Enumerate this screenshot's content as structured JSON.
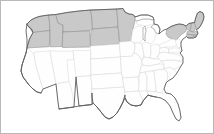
{
  "figure": {
    "type": "choropleth-map",
    "region": "United States",
    "width": 214,
    "height": 134,
    "background_color": "#ffffff",
    "border_color": "#b9b9b9"
  },
  "legend": {
    "shaded_color": "#c9c9c9",
    "shaded_border_color": "#8e8e8e",
    "unshaded_color": "#fefefe",
    "unshaded_border_color": "#d8d8d8",
    "outline_color": "#5f5f5f"
  },
  "chart_data": {
    "type": "map",
    "title": "",
    "subtitle": "",
    "xlabel": "",
    "ylabel": "",
    "legend_position": "none",
    "grid": false,
    "value_scale": [
      "unshaded",
      "shaded"
    ],
    "categories": [
      "WA",
      "OR",
      "ID",
      "MT",
      "WY",
      "ND",
      "SD",
      "MN",
      "CA",
      "NV",
      "UT",
      "AZ",
      "CO",
      "NM",
      "NE",
      "KS",
      "OK",
      "TX",
      "IA",
      "MO",
      "AR",
      "LA",
      "WI",
      "MI",
      "IL",
      "IN",
      "OH",
      "KY",
      "TN",
      "MS",
      "AL",
      "GA",
      "FL",
      "SC",
      "NC",
      "VA",
      "WV",
      "PA",
      "NY",
      "VT",
      "NH",
      "ME",
      "MA",
      "RI",
      "CT",
      "NJ",
      "DE",
      "MD"
    ],
    "values": [
      1,
      1,
      1,
      1,
      1,
      1,
      1,
      1,
      0,
      0,
      0,
      0,
      0,
      0,
      0,
      0,
      0,
      0,
      0,
      0,
      0,
      0,
      0,
      0,
      0,
      0,
      0,
      0,
      0,
      0,
      0,
      0,
      0,
      0,
      0,
      0,
      0,
      0,
      1,
      1,
      1,
      1,
      1,
      1,
      1,
      0,
      0,
      0
    ],
    "series": [
      {
        "name": "highlighted",
        "states": [
          "Washington",
          "Oregon",
          "Idaho",
          "Montana",
          "Wyoming",
          "North Dakota",
          "South Dakota",
          "Minnesota",
          "New York",
          "Vermont",
          "New Hampshire",
          "Maine",
          "Massachusetts",
          "Rhode Island",
          "Connecticut"
        ]
      },
      {
        "name": "not-highlighted",
        "states": [
          "California",
          "Nevada",
          "Utah",
          "Arizona",
          "Colorado",
          "New Mexico",
          "Nebraska",
          "Kansas",
          "Oklahoma",
          "Texas",
          "Iowa",
          "Missouri",
          "Arkansas",
          "Louisiana",
          "Wisconsin",
          "Michigan",
          "Illinois",
          "Indiana",
          "Ohio",
          "Kentucky",
          "Tennessee",
          "Mississippi",
          "Alabama",
          "Georgia",
          "Florida",
          "South Carolina",
          "North Carolina",
          "Virginia",
          "West Virginia",
          "Pennsylvania",
          "New Jersey",
          "Delaware",
          "Maryland"
        ]
      }
    ]
  }
}
